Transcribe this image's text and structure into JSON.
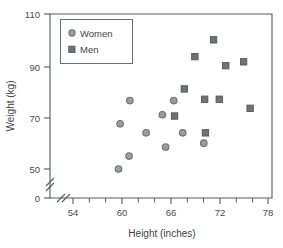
{
  "chart_data": {
    "type": "scatter",
    "title": "",
    "xlabel": "Height (inches)",
    "ylabel": "Weight (kg)",
    "xlim": [
      52,
      78
    ],
    "ylim": [
      45,
      110
    ],
    "x_ticks": [
      54,
      60,
      66,
      72,
      78
    ],
    "x_tick_labels": [
      "54",
      "60",
      "66",
      "72",
      "78"
    ],
    "x_minor_ticks": [
      56,
      58,
      62,
      64,
      68,
      70,
      74,
      76
    ],
    "y_ticks": [
      50,
      70,
      90,
      110
    ],
    "y_tick_labels": [
      "50",
      "70",
      "90",
      "110"
    ],
    "y_zero_label": "0",
    "y_axis_break": true,
    "x_axis_break": true,
    "grid": false,
    "legend_position": "top-left",
    "series": [
      {
        "name": "Women",
        "marker": "circle",
        "color": "#9b9ea1",
        "points": [
          {
            "x": 59.6,
            "y": 50.0
          },
          {
            "x": 59.8,
            "y": 67.5
          },
          {
            "x": 60.9,
            "y": 55.0
          },
          {
            "x": 61.0,
            "y": 76.5
          },
          {
            "x": 63.0,
            "y": 64.0
          },
          {
            "x": 65.0,
            "y": 71.0
          },
          {
            "x": 65.4,
            "y": 58.5
          },
          {
            "x": 66.4,
            "y": 76.5
          },
          {
            "x": 67.5,
            "y": 64.0
          },
          {
            "x": 70.1,
            "y": 60.0
          }
        ]
      },
      {
        "name": "Men",
        "marker": "square",
        "color": "#6f7376",
        "points": [
          {
            "x": 66.5,
            "y": 70.5
          },
          {
            "x": 67.7,
            "y": 81.0
          },
          {
            "x": 69.0,
            "y": 93.5
          },
          {
            "x": 70.2,
            "y": 77.0
          },
          {
            "x": 70.3,
            "y": 64.0
          },
          {
            "x": 71.3,
            "y": 100.0
          },
          {
            "x": 72.0,
            "y": 77.0
          },
          {
            "x": 72.8,
            "y": 90.0
          },
          {
            "x": 75.0,
            "y": 91.5
          },
          {
            "x": 75.8,
            "y": 73.5
          }
        ]
      }
    ]
  },
  "legend": {
    "entries": [
      {
        "label": "Women",
        "marker": "circle-marker"
      },
      {
        "label": "Men",
        "marker": "square-marker"
      }
    ]
  }
}
